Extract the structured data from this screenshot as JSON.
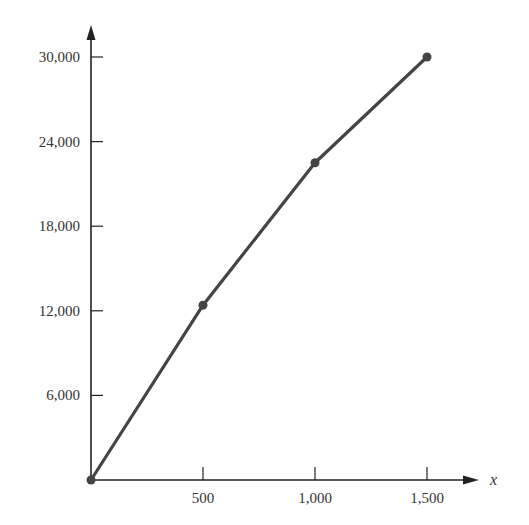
{
  "chart_data": {
    "type": "line",
    "title": "",
    "xlabel": "x",
    "ylabel": "",
    "x": [
      0,
      500,
      1000,
      1500
    ],
    "series": [
      {
        "name": "",
        "values": [
          0,
          12400,
          22500,
          30000
        ]
      }
    ],
    "x_ticks": [
      500,
      1000,
      1500
    ],
    "x_tick_labels": [
      "500",
      "1,000",
      "1,500"
    ],
    "y_ticks": [
      6000,
      12000,
      18000,
      24000,
      30000
    ],
    "y_tick_labels": [
      "6,000",
      "12,000",
      "18,000",
      "24,000",
      "30,000"
    ],
    "xlim": [
      0,
      1700
    ],
    "ylim": [
      0,
      32000
    ],
    "grid": false,
    "legend": "none",
    "markers": true
  },
  "colors": {
    "axis": "#222222",
    "line": "#444444",
    "marker": "#444444",
    "text": "#333333"
  }
}
